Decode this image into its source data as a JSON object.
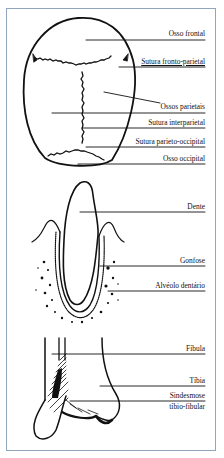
{
  "figure": {
    "panels": [
      {
        "name": "skull",
        "labels": [
          "Osso frontal",
          "Sutura fronto-parietal",
          "Ossos parietais",
          "Sutura interparietal",
          "Sutura parieto-occipital",
          "Osso occipital"
        ]
      },
      {
        "name": "tooth",
        "labels": [
          "Dente",
          "Gonfose",
          "Alvéolo dentário"
        ]
      },
      {
        "name": "ankle",
        "labels": [
          "Fíbula",
          "Tíbia",
          "Sindesmose",
          "tíbio-fibular"
        ]
      }
    ],
    "colors": {
      "frame_border": "#8fa6bd",
      "ink": "#111111",
      "background": "#ffffff"
    }
  }
}
